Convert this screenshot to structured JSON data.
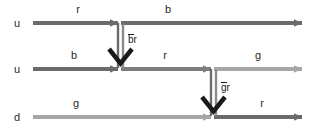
{
  "figure": {
    "type": "feynman-color-flow-diagram",
    "background": "#ffffff",
    "width": 316,
    "height": 137
  },
  "colors": {
    "line_dark": "#6b6b6b",
    "line_mid": "#7d7d7d",
    "line_light": "#a6a6a6",
    "gluon": "#595959",
    "arrow_black": "#1a1a1a",
    "text": "#2b2b2b"
  },
  "quark_lines": [
    {
      "id": "line-top",
      "particle_label": "u",
      "y": 23,
      "segments": [
        {
          "id": "top-left",
          "color_label": "r",
          "label_x": 78,
          "label_y": 13
        },
        {
          "id": "top-right",
          "color_label": "b",
          "label_x": 168,
          "label_y": 13
        }
      ]
    },
    {
      "id": "line-middle",
      "particle_label": "u",
      "y": 69,
      "segments": [
        {
          "id": "mid-left",
          "color_label": "b",
          "label_x": 74,
          "label_y": 59
        },
        {
          "id": "mid-center",
          "color_label": "r",
          "label_x": 165,
          "label_y": 59
        },
        {
          "id": "mid-right",
          "color_label": "g",
          "label_x": 258,
          "label_y": 59
        }
      ]
    },
    {
      "id": "line-bottom",
      "particle_label": "d",
      "y": 117,
      "segments": [
        {
          "id": "bot-left",
          "color_label": "g",
          "label_x": 76,
          "label_y": 107
        },
        {
          "id": "bot-right",
          "color_label": "r",
          "label_x": 262,
          "label_y": 107
        }
      ]
    }
  ],
  "gluons": [
    {
      "id": "gluon-upper",
      "label": "br",
      "label_bar_over": "b",
      "label_x": 125,
      "label_y": 43,
      "x": 120,
      "y_from": 23,
      "y_to": 69
    },
    {
      "id": "gluon-lower",
      "label": "gr",
      "label_bar_over": "g",
      "label_x": 218,
      "label_y": 91,
      "x": 213,
      "y_from": 69,
      "y_to": 117
    }
  ],
  "particle_labels": [
    {
      "id": "u-top",
      "text": "u",
      "x": 17,
      "y": 27
    },
    {
      "id": "u-middle",
      "text": "u",
      "x": 17,
      "y": 73
    },
    {
      "id": "d-bottom",
      "text": "d",
      "x": 17,
      "y": 121
    }
  ]
}
